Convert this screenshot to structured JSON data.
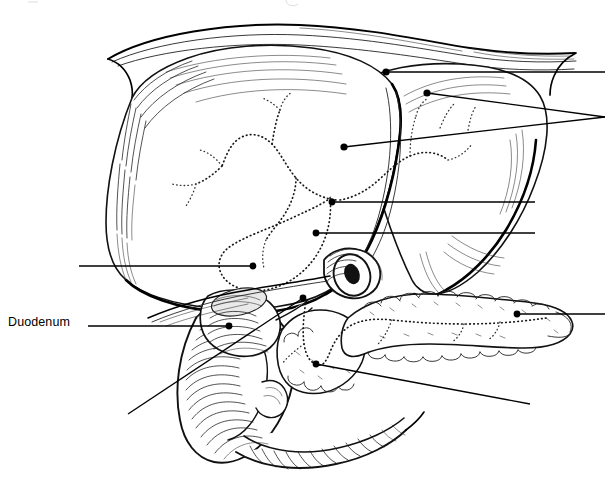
{
  "figure": {
    "width": 605,
    "height": 494,
    "background_color": "#ffffff",
    "ink_color": "#000000",
    "style": "black-and-white engraved line art with stipple and hatching"
  },
  "labels": [
    {
      "id": "duodenum",
      "text": "Duodenum",
      "x": 8,
      "y": 316,
      "anchor": "left",
      "visible": true
    }
  ],
  "leaders": [
    {
      "id": "leader-liver-upper-right",
      "target_name": "liver-upper-right-lobe",
      "dot": [
        386,
        72
      ],
      "path": "M 386 72 L 605 72",
      "label_id": null,
      "label_offscreen": true
    },
    {
      "id": "leader-liver-right-lobe",
      "target_name": "liver-right-lobe",
      "dot": [
        427,
        93
      ],
      "path": "M 427 93 L 605 117",
      "label_id": null,
      "label_offscreen": true
    },
    {
      "id": "leader-liver-hilum",
      "target_name": "liver-hilum-duct",
      "dot": [
        344,
        147
      ],
      "path": "M 344 147 L 605 117",
      "label_id": null,
      "label_offscreen": true
    },
    {
      "id": "leader-cystic-duct",
      "target_name": "cystic-duct-junction",
      "dot": [
        332,
        202
      ],
      "path": "M 332 202 L 535 202",
      "label_id": null,
      "label_offscreen": true
    },
    {
      "id": "leader-common-bile-duct",
      "target_name": "common-bile-duct",
      "dot": [
        316,
        233
      ],
      "path": "M 316 233 L 535 233",
      "label_id": null,
      "label_offscreen": true
    },
    {
      "id": "leader-gallbladder",
      "target_name": "gallbladder-fundus",
      "dot": [
        253,
        266
      ],
      "path": "M 79 266 L 253 266",
      "label_id": null,
      "label_offscreen": true
    },
    {
      "id": "leader-duodenum",
      "target_name": "duodenum-descending-part",
      "dot": [
        229,
        326
      ],
      "path": "M 88 326 L 229 326",
      "label_id": "duodenum",
      "label_offscreen": false
    },
    {
      "id": "leader-pancreas-tail",
      "target_name": "pancreas-tail",
      "dot": [
        517,
        314
      ],
      "path": "M 517 314 L 605 314",
      "label_id": null,
      "label_offscreen": true
    },
    {
      "id": "leader-ampulla",
      "target_name": "ampulla-of-vater",
      "dot": [
        303,
        298
      ],
      "path": "M 303 298 L 128 414",
      "label_id": null,
      "label_offscreen": true
    },
    {
      "id": "leader-pancreatic-duct",
      "target_name": "main-pancreatic-duct",
      "dot": [
        316,
        364
      ],
      "path": "M 316 364 L 530 404",
      "label_id": null,
      "label_offscreen": true
    }
  ],
  "structures": [
    {
      "id": "diaphragm",
      "name": "Diaphragm band above liver"
    },
    {
      "id": "liver-left-lobe",
      "name": "Left lobe of liver"
    },
    {
      "id": "liver-right-lobe",
      "name": "Right lobe of liver"
    },
    {
      "id": "gallbladder",
      "name": "Gallbladder"
    },
    {
      "id": "duodenum",
      "name": "Duodenum (C-loop)"
    },
    {
      "id": "pancreas",
      "name": "Pancreas head, body and tail"
    },
    {
      "id": "biliary-tree",
      "name": "Intrahepatic biliary tree (dotted)"
    },
    {
      "id": "pancreatic-duct",
      "name": "Main pancreatic duct (dotted)"
    },
    {
      "id": "portal-vessel",
      "name": "Cut vessel / portal stump ring"
    }
  ]
}
